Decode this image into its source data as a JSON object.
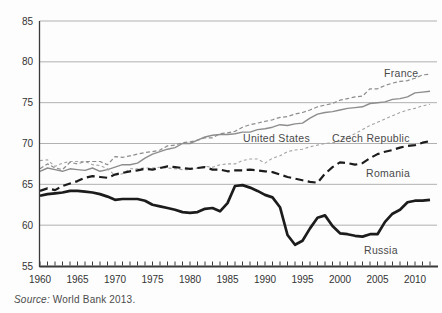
{
  "figure": {
    "source_prefix": "Source:",
    "source_text": " World Bank 2013."
  },
  "chart_data": {
    "type": "line",
    "title": "",
    "xlabel": "",
    "ylabel": "",
    "x_start": 1960,
    "x_end": 2012,
    "xlim": [
      1960,
      2013
    ],
    "ylim": [
      55,
      85
    ],
    "yticks": [
      55,
      60,
      65,
      70,
      75,
      80,
      85
    ],
    "xticks": [
      1960,
      1965,
      1970,
      1975,
      1980,
      1985,
      1990,
      1995,
      2000,
      2005,
      2010
    ],
    "grid": "horizontal",
    "legend": "inline-labels",
    "axis_color": "#3a3a3a",
    "grid_color": "#b1b1b1",
    "label_color": "#4a4a4a",
    "series": [
      {
        "name": "France",
        "color": "#8d8d8d",
        "dash": "4 2.5",
        "width": 1.2,
        "values": [
          66.9,
          67.5,
          67.0,
          66.8,
          67.7,
          67.5,
          67.8,
          67.8,
          67.8,
          67.4,
          68.4,
          68.3,
          68.5,
          68.7,
          68.9,
          69.0,
          69.2,
          69.7,
          69.8,
          70.1,
          70.2,
          70.4,
          70.7,
          70.7,
          71.2,
          71.3,
          71.5,
          72.0,
          72.3,
          72.5,
          72.7,
          72.9,
          73.2,
          73.3,
          73.6,
          73.8,
          74.1,
          74.5,
          74.7,
          74.9,
          75.3,
          75.5,
          75.7,
          75.8,
          76.7,
          76.7,
          77.1,
          77.4,
          77.6,
          77.7,
          78.0,
          78.4,
          78.5
        ]
      },
      {
        "name": "United States",
        "color": "#8d8d8d",
        "dash": "",
        "width": 1.4,
        "values": [
          66.6,
          67.0,
          66.8,
          66.6,
          66.9,
          66.8,
          66.7,
          67.0,
          66.6,
          66.8,
          67.1,
          67.4,
          67.4,
          67.6,
          68.2,
          68.7,
          69.0,
          69.3,
          69.5,
          70.0,
          70.0,
          70.4,
          70.8,
          71.0,
          71.1,
          71.1,
          71.2,
          71.4,
          71.4,
          71.7,
          71.8,
          72.0,
          72.3,
          72.2,
          72.4,
          72.5,
          73.1,
          73.6,
          73.8,
          73.9,
          74.1,
          74.3,
          74.4,
          74.5,
          74.9,
          75.0,
          75.1,
          75.4,
          75.5,
          75.7,
          76.2,
          76.3,
          76.4
        ]
      },
      {
        "name": "Czech Republic",
        "color": "#a3a3a3",
        "dash": "3 2.5",
        "width": 1.1,
        "values": [
          67.9,
          68.0,
          67.2,
          67.6,
          67.8,
          67.8,
          67.8,
          67.4,
          67.3,
          66.9,
          66.1,
          66.3,
          66.9,
          66.9,
          67.0,
          67.0,
          67.1,
          67.0,
          66.9,
          66.8,
          66.8,
          67.0,
          67.2,
          67.1,
          67.4,
          67.5,
          67.5,
          67.9,
          68.1,
          68.1,
          67.6,
          68.2,
          68.5,
          69.0,
          69.2,
          69.3,
          69.6,
          69.8,
          70.0,
          70.1,
          70.3,
          70.8,
          71.2,
          71.7,
          72.2,
          72.6,
          73.0,
          73.4,
          73.8,
          74.1,
          74.3,
          74.6,
          74.8
        ]
      },
      {
        "name": "Romania",
        "color": "#1c1c1c",
        "dash": "8 4.5",
        "width": 2.2,
        "values": [
          64.2,
          64.5,
          64.3,
          64.8,
          65.1,
          65.4,
          65.8,
          66.0,
          65.9,
          65.8,
          66.2,
          66.4,
          66.6,
          66.7,
          66.9,
          66.8,
          67.0,
          67.2,
          67.1,
          67.0,
          66.9,
          67.0,
          67.1,
          66.8,
          66.8,
          66.6,
          66.7,
          66.7,
          66.8,
          66.7,
          66.6,
          66.5,
          66.2,
          65.9,
          65.7,
          65.5,
          65.3,
          65.2,
          66.3,
          67.1,
          67.7,
          67.6,
          67.4,
          67.6,
          68.2,
          68.7,
          69.0,
          69.2,
          69.5,
          69.7,
          69.8,
          70.1,
          70.3
        ]
      },
      {
        "name": "Russia",
        "color": "#1c1c1c",
        "dash": "",
        "width": 2.7,
        "values": [
          63.6,
          63.8,
          63.9,
          64.0,
          64.2,
          64.2,
          64.1,
          64.0,
          63.8,
          63.5,
          63.1,
          63.2,
          63.2,
          63.2,
          63.0,
          62.5,
          62.3,
          62.1,
          61.9,
          61.6,
          61.5,
          61.6,
          62.0,
          62.1,
          61.7,
          62.7,
          64.8,
          64.9,
          64.6,
          64.2,
          63.7,
          63.4,
          62.2,
          58.8,
          57.6,
          58.1,
          59.6,
          60.9,
          61.2,
          59.9,
          59.0,
          58.9,
          58.7,
          58.6,
          58.9,
          58.9,
          60.4,
          61.4,
          61.9,
          62.8,
          63.0,
          63.0,
          63.1
        ]
      }
    ]
  }
}
